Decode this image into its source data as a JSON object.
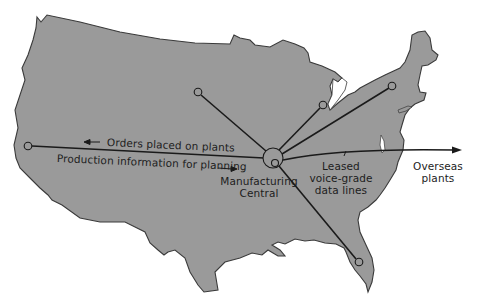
{
  "figure": {
    "type": "network map of United States",
    "colors": {
      "land": "#9a9a9a",
      "coast": "#3a3a3a",
      "line": "#1a1a1a",
      "background": "#ffffff",
      "text": "#1d1d1d"
    }
  },
  "nodes": [
    {
      "id": "west-coast-plant",
      "x": 28,
      "y": 146
    },
    {
      "id": "midwest-plant",
      "x": 198,
      "y": 92
    },
    {
      "id": "great-lakes-plant",
      "x": 323,
      "y": 105
    },
    {
      "id": "northeast-plant",
      "x": 392,
      "y": 86
    },
    {
      "id": "florida-plant",
      "x": 359,
      "y": 262
    },
    {
      "id": "manufacturing-central",
      "x": 273,
      "y": 158
    }
  ],
  "labels": {
    "orders_arrow_text": "Orders placed on plants",
    "production_arrow_text": "Production information for planning",
    "central_line1": "Manufacturing",
    "central_line2": "Central",
    "leased_line1": "Leased",
    "leased_line2": "voice-grade",
    "leased_line3": "data lines",
    "overseas_line1": "Overseas",
    "overseas_line2": "plants"
  }
}
